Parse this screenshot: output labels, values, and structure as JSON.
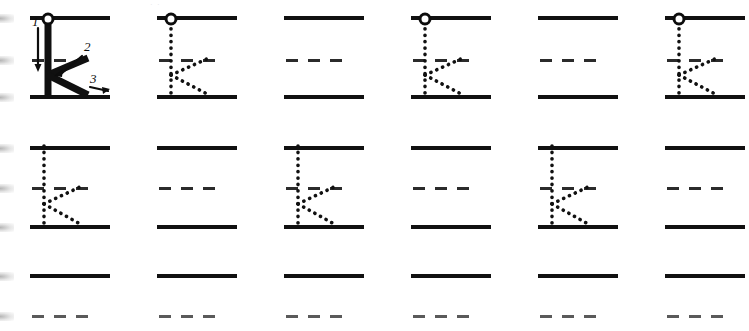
{
  "worksheet": {
    "letter": "K",
    "title": "Letter K Handwriting Practice",
    "masthead_faint": "· ·",
    "instruction_model_label": "K",
    "stroke_guide": {
      "steps": [
        {
          "number": "1",
          "name": "vertical-stem",
          "direction": "down"
        },
        {
          "number": "2",
          "name": "upper-diagonal-arm",
          "direction": "down-left"
        },
        {
          "number": "3",
          "name": "lower-diagonal-leg",
          "direction": "down-right"
        }
      ]
    },
    "colors": {
      "ink": "#111111",
      "rule_line": "#111111",
      "midline_dash": "#2b2b2b",
      "paper": "#ffffff",
      "start_dot_fill": "#ffffff"
    },
    "metrics": {
      "columns": 6,
      "rows": 3,
      "cell_width": 80,
      "cell_step": 127,
      "first_cell_x": 30
    },
    "rows": [
      {
        "index": 1,
        "name": "row-1",
        "top_y": 18,
        "mid_y": 60,
        "base_y": 97,
        "clipped_bottom": false,
        "cells": [
          {
            "name": "model-letter-cell",
            "type": "model",
            "letter": "K",
            "show_start_dot": true,
            "show_numbers": true,
            "clipped_left": true
          },
          {
            "name": "trace-letter-cell",
            "type": "trace",
            "letter": "K",
            "show_start_dot": true,
            "show_numbers": false
          },
          {
            "name": "blank-practice-cell",
            "type": "blank",
            "letter": "",
            "show_start_dot": false,
            "show_numbers": false
          },
          {
            "name": "trace-letter-cell",
            "type": "trace",
            "letter": "K",
            "show_start_dot": true,
            "show_numbers": false
          },
          {
            "name": "blank-practice-cell",
            "type": "blank",
            "letter": "",
            "show_start_dot": false,
            "show_numbers": false
          },
          {
            "name": "trace-letter-cell",
            "type": "trace",
            "letter": "K",
            "show_start_dot": true,
            "show_numbers": false,
            "clipped_right": true
          }
        ]
      },
      {
        "index": 2,
        "name": "row-2",
        "top_y": 148,
        "mid_y": 188,
        "base_y": 227,
        "clipped_bottom": false,
        "cells": [
          {
            "name": "trace-letter-cell",
            "type": "trace",
            "letter": "K",
            "show_start_dot": false,
            "show_numbers": false,
            "clipped_left": true
          },
          {
            "name": "blank-practice-cell",
            "type": "blank",
            "letter": "",
            "show_start_dot": false,
            "show_numbers": false
          },
          {
            "name": "trace-letter-cell",
            "type": "trace",
            "letter": "K",
            "show_start_dot": false,
            "show_numbers": false
          },
          {
            "name": "blank-practice-cell",
            "type": "blank",
            "letter": "",
            "show_start_dot": false,
            "show_numbers": false
          },
          {
            "name": "trace-letter-cell",
            "type": "trace",
            "letter": "K",
            "show_start_dot": false,
            "show_numbers": false
          },
          {
            "name": "blank-practice-cell",
            "type": "blank",
            "letter": "",
            "show_start_dot": false,
            "show_numbers": false
          }
        ]
      },
      {
        "index": 3,
        "name": "row-3",
        "top_y": 276,
        "mid_y": 316,
        "base_y": 355,
        "clipped_bottom": true,
        "cells": [
          {
            "name": "blank-practice-cell",
            "type": "blank",
            "letter": "",
            "show_start_dot": false,
            "show_numbers": false,
            "clipped_left": true
          },
          {
            "name": "blank-practice-cell",
            "type": "blank",
            "letter": "",
            "show_start_dot": false,
            "show_numbers": false
          },
          {
            "name": "blank-practice-cell",
            "type": "blank",
            "letter": "",
            "show_start_dot": false,
            "show_numbers": false
          },
          {
            "name": "blank-practice-cell",
            "type": "blank",
            "letter": "",
            "show_start_dot": false,
            "show_numbers": false
          },
          {
            "name": "blank-practice-cell",
            "type": "blank",
            "letter": "",
            "show_start_dot": false,
            "show_numbers": false
          },
          {
            "name": "blank-practice-cell",
            "type": "blank",
            "letter": "",
            "show_start_dot": false,
            "show_numbers": false
          }
        ]
      }
    ]
  }
}
